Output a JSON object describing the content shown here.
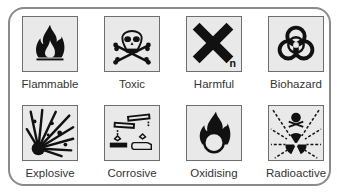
{
  "symbols": [
    {
      "label": "Flammable",
      "icon": "flame-icon"
    },
    {
      "label": "Toxic",
      "icon": "skull-crossbones-icon"
    },
    {
      "label": "Harmful",
      "icon": "cross-x-icon",
      "mark": "n"
    },
    {
      "label": "Biohazard",
      "icon": "biohazard-icon"
    },
    {
      "label": "Explosive",
      "icon": "explosion-icon"
    },
    {
      "label": "Corrosive",
      "icon": "corrosive-icon"
    },
    {
      "label": "Oxidising",
      "icon": "flame-over-circle-icon"
    },
    {
      "label": "Radioactive",
      "icon": "radioactive-icon"
    }
  ],
  "colors": {
    "border": "#8a8a8a",
    "symbol_bg": "#e9e9e9",
    "ink": "#111111"
  }
}
